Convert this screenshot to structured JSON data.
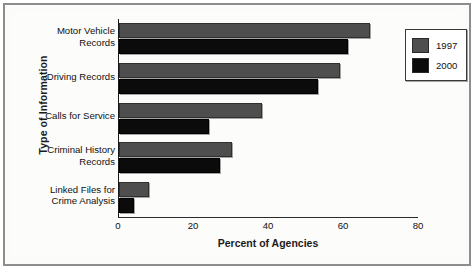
{
  "chart_data": {
    "type": "bar",
    "orientation": "horizontal",
    "title": "",
    "xlabel": "Percent of Agencies",
    "ylabel": "Type of Information",
    "xlim": [
      0,
      80
    ],
    "xticks": [
      0,
      20,
      40,
      60,
      80
    ],
    "grid": false,
    "legend_position": "top-right",
    "categories": [
      "Motor Vehicle Records",
      "Driving Records",
      "Calls for Service",
      "Criminal History Records",
      "Linked Files for Crime Analysis"
    ],
    "category_lines": [
      [
        "Motor Vehicle",
        "Records"
      ],
      [
        "Driving Records"
      ],
      [
        "Calls for Service"
      ],
      [
        "Criminal History",
        "Records"
      ],
      [
        "Linked Files for",
        "Crime Analysis"
      ]
    ],
    "series": [
      {
        "name": "1997",
        "color": "#4e4e4e",
        "values": [
          67,
          59,
          38,
          30,
          8
        ]
      },
      {
        "name": "2000",
        "color": "#0b0b0b",
        "values": [
          61,
          53,
          24,
          27,
          4
        ]
      }
    ]
  },
  "legend": {
    "entries": [
      {
        "label": "1997",
        "color": "#4e4e4e"
      },
      {
        "label": "2000",
        "color": "#0b0b0b"
      }
    ]
  }
}
